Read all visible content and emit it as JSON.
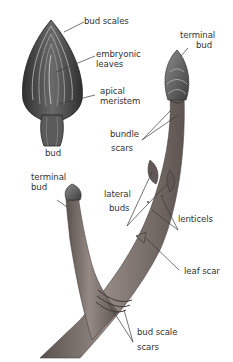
{
  "caption": "",
  "colors": {
    "text": "#333333",
    "leader": "#3a3a3a",
    "bud_dark": "#3f3f3f",
    "bud_mid": "#6b6b6b",
    "bud_light": "#bdbdbd",
    "twig_dark": "#5e5552",
    "twig_mid": "#8a7f7a",
    "twig_light": "#b5aca6"
  },
  "labels": {
    "bud_scales": "bud scales",
    "embryonic_leaves_1": "embryonic",
    "embryonic_leaves_2": "leaves",
    "apical_meristem_1": "apical",
    "apical_meristem_2": "meristem",
    "bud": "bud",
    "terminal_bud_top_1": "terminal",
    "terminal_bud_top_2": "bud",
    "bundle_scars_1": "bundle",
    "bundle_scars_2": "scars",
    "terminal_bud_left_1": "terminal",
    "terminal_bud_left_2": "bud",
    "lateral_buds_1": "lateral",
    "lateral_buds_2": "buds",
    "lenticels": "lenticels",
    "leaf_scar": "leaf scar",
    "bud_scale_scars_1": "bud scale",
    "bud_scale_scars_2": "scars"
  }
}
